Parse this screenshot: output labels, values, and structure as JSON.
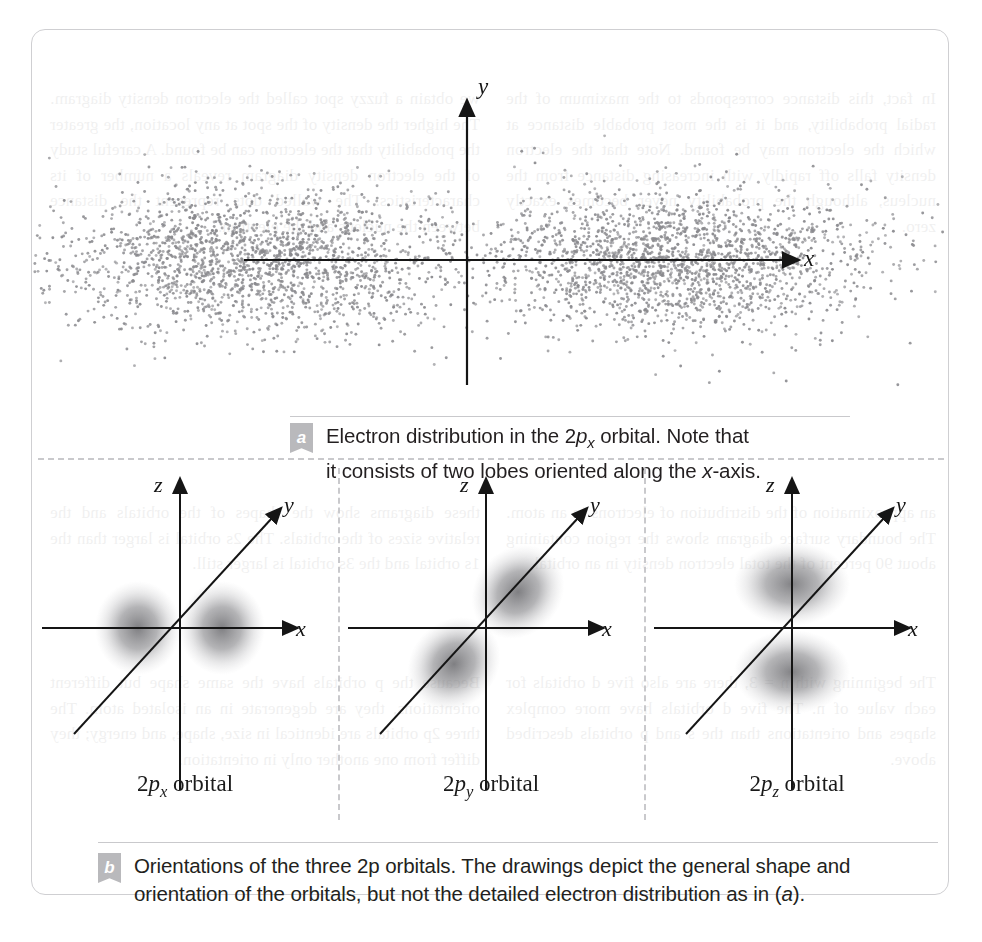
{
  "figure": {
    "panel_a": {
      "badge": "a",
      "caption_line1_pre": "Electron distribution in the 2",
      "caption_italic_p": "p",
      "caption_sub": "x",
      "caption_line1_post": " orbital. Note that",
      "caption_line2_pre": "it consists of two lobes oriented along the ",
      "caption_line2_italic": "x",
      "caption_line2_post": "-axis.",
      "axis_x_label": "x",
      "axis_y_label": "y"
    },
    "panel_b": {
      "badge": "b",
      "caption_line1": "Orientations of the three 2p orbitals. The drawings depict the general shape and",
      "caption_line2_pre": "orientation of the orbitals, but not the detailed electron distribution as in (",
      "caption_line2_italic": "a",
      "caption_line2_post": ").",
      "orbitals": [
        {
          "id": "2px",
          "prefix": "2",
          "italic": "p",
          "sub": "x",
          "suffix": " orbital",
          "axis_x": "x",
          "axis_y": "y",
          "axis_z": "z",
          "orientation": "x-axis"
        },
        {
          "id": "2py",
          "prefix": "2",
          "italic": "p",
          "sub": "y",
          "suffix": " orbital",
          "axis_x": "x",
          "axis_y": "y",
          "axis_z": "z",
          "orientation": "y-axis"
        },
        {
          "id": "2pz",
          "prefix": "2",
          "italic": "p",
          "sub": "z",
          "suffix": " orbital",
          "axis_x": "x",
          "axis_y": "y",
          "axis_z": "z",
          "orientation": "z-axis"
        }
      ]
    }
  },
  "colors": {
    "frame_border": "#cfcfd2",
    "divider": "#c9c9cc",
    "badge_bg": "#b9b9bc",
    "axis": "#151515",
    "dot": "#8a8a8e",
    "lobe": "#7c7c80",
    "text": "#231f20",
    "page_background": "#ffffff"
  },
  "chart_data": {
    "type": "scatter",
    "xlabel": "x",
    "ylabel": "y",
    "grid": false,
    "legend": null,
    "n_points": 4200,
    "lobes": [
      {
        "name": "negative-x lobe",
        "center_x": -0.62,
        "center_y": 0.0,
        "sigma_x": 0.3,
        "sigma_y": 0.28,
        "fraction": 0.5
      },
      {
        "name": "positive-x lobe",
        "center_x": 0.62,
        "center_y": 0.0,
        "sigma_x": 0.3,
        "sigma_y": 0.28,
        "fraction": 0.5
      }
    ],
    "nodal_plane_x": 0,
    "xlim": [
      -1.6,
      1.6
    ],
    "ylim": [
      -1.25,
      1.25
    ],
    "axis_ticks": []
  },
  "bleed_text": {
    "left_top": "we obtain a fuzzy spot called the electron density diagram. The higher the density of the spot at any location, the greater the probability that the electron can be found. A careful study of the electron density diagram reveals a number of its characteristics. The walled dots represent the distance between the nucleus and the electron.",
    "right_top": "In fact, this distance corresponds to the maximum of the radial probability, and it is the most probable distance at which the electron may be found. Note that the electron density falls off rapidly with increasing distance from the nucleus, although the probability never becomes exactly zero.",
    "left_mid": "these diagrams show the shapes of the orbitals and the relative sizes of the orbitals. The 2s orbital is larger than the 1s orbital and the 3s orbital is larger still.",
    "right_mid": "an approximation of the distribution of electrons in an atom. The boundary surface diagram shows the region containing about 90 percent of the total electron density in an orbital.",
    "left_bot": "Because the p orbitals have the same shape but different orientations, they are degenerate in an isolated atom. The three 2p orbitals are identical in size, shape, and energy; they differ from one another only in orientation.",
    "right_bot": "The beginning with n = 3, there are also five d orbitals for each value of n. The five d orbitals have more complex shapes and orientations than the s and p orbitals described above."
  }
}
